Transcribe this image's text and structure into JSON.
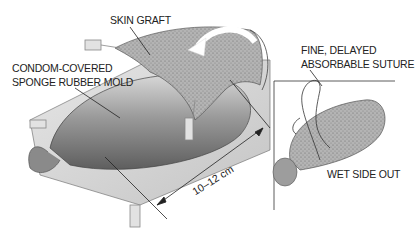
{
  "figure": {
    "type": "surgical illustration",
    "labels": {
      "skin_graft": "SKIN GRAFT",
      "mold_line1": "CONDOM-COVERED",
      "mold_line2": "SPONGE RUBBER MOLD",
      "suture_line1": "FINE, DELAYED",
      "suture_line2": "ABSORBABLE SUTURE",
      "wet_side": "WET SIDE OUT",
      "dimension": "10–12 cm"
    },
    "colors": {
      "ink": "#222222",
      "graft_fill": "#a8a8a8",
      "mold_fill": "#9a9a9a",
      "background": "#ffffff"
    }
  }
}
